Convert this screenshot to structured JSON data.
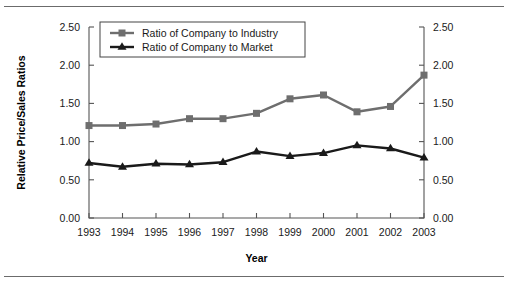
{
  "chart_data": {
    "type": "line",
    "title": "",
    "xlabel": "Year",
    "ylabel": "Relative Price/Sales Ratios",
    "ylabel_right": "Relative Price/Sales Ratios",
    "categories": [
      "1993",
      "1994",
      "1995",
      "1996",
      "1997",
      "1998",
      "1999",
      "2000",
      "2001",
      "2002",
      "2003"
    ],
    "x": [
      1993,
      1994,
      1995,
      1996,
      1997,
      1998,
      1999,
      2000,
      2001,
      2002,
      2003
    ],
    "ylim": [
      0.0,
      2.5
    ],
    "yticks": [
      0.0,
      0.5,
      1.0,
      1.5,
      2.0,
      2.5
    ],
    "ytick_labels": [
      "0.00",
      "0.50",
      "1.00",
      "1.50",
      "2.00",
      "2.50"
    ],
    "ytick_labels_right": [
      "0.00",
      "0.50",
      "1.00",
      "1.50",
      "2.00",
      "2.50"
    ],
    "grid": false,
    "legend_position": "top-left-inside",
    "series": [
      {
        "name": "Ratio of Company to Industry",
        "color": "#6e6e6e",
        "marker": "square",
        "values": [
          1.21,
          1.21,
          1.23,
          1.3,
          1.3,
          1.37,
          1.56,
          1.61,
          1.39,
          1.46,
          1.87
        ]
      },
      {
        "name": "Ratio of Company to Market",
        "color": "#1a1a1a",
        "marker": "triangle",
        "values": [
          0.72,
          0.67,
          0.71,
          0.7,
          0.73,
          0.87,
          0.81,
          0.85,
          0.95,
          0.91,
          0.79
        ]
      }
    ]
  },
  "legend": {
    "items": [
      {
        "label": "Ratio of Company to Industry"
      },
      {
        "label": "Ratio of Company to Market"
      }
    ]
  }
}
